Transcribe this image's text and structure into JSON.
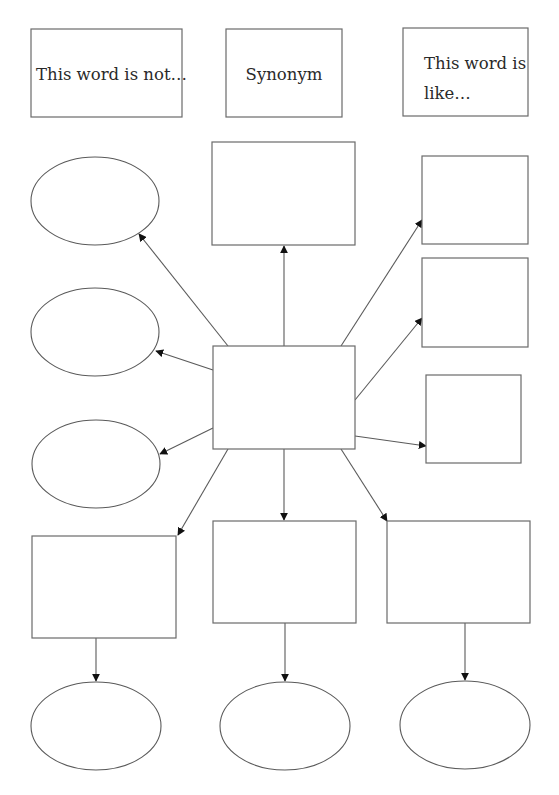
{
  "diagram": {
    "type": "vocabulary-concept-map",
    "header_boxes": [
      {
        "id": "not-box",
        "label_lines": [
          "This word is not…"
        ]
      },
      {
        "id": "synonym-box",
        "label_lines": [
          "Synonym"
        ]
      },
      {
        "id": "like-box",
        "label_lines": [
          "This word is",
          "like…"
        ]
      }
    ],
    "center_node": {
      "id": "center",
      "label": ""
    },
    "nodes": [
      {
        "id": "ellipse-left-1",
        "shape": "ellipse",
        "label": ""
      },
      {
        "id": "ellipse-left-2",
        "shape": "ellipse",
        "label": ""
      },
      {
        "id": "ellipse-left-3",
        "shape": "ellipse",
        "label": ""
      },
      {
        "id": "box-top",
        "shape": "rect",
        "label": ""
      },
      {
        "id": "box-right-1",
        "shape": "rect",
        "label": ""
      },
      {
        "id": "box-right-2",
        "shape": "rect",
        "label": ""
      },
      {
        "id": "box-right-3",
        "shape": "rect",
        "label": ""
      },
      {
        "id": "box-bottom-left",
        "shape": "rect",
        "label": ""
      },
      {
        "id": "box-bottom-center",
        "shape": "rect",
        "label": ""
      },
      {
        "id": "box-bottom-right",
        "shape": "rect",
        "label": ""
      },
      {
        "id": "ellipse-bottom-left",
        "shape": "ellipse",
        "label": ""
      },
      {
        "id": "ellipse-bottom-center",
        "shape": "ellipse",
        "label": ""
      },
      {
        "id": "ellipse-bottom-right",
        "shape": "ellipse",
        "label": ""
      }
    ],
    "edges": [
      {
        "from": "center",
        "to": "ellipse-left-1"
      },
      {
        "from": "center",
        "to": "ellipse-left-2"
      },
      {
        "from": "center",
        "to": "ellipse-left-3"
      },
      {
        "from": "center",
        "to": "box-top"
      },
      {
        "from": "center",
        "to": "box-right-1"
      },
      {
        "from": "center",
        "to": "box-right-2"
      },
      {
        "from": "center",
        "to": "box-right-3"
      },
      {
        "from": "center",
        "to": "box-bottom-left"
      },
      {
        "from": "center",
        "to": "box-bottom-center"
      },
      {
        "from": "center",
        "to": "box-bottom-right"
      },
      {
        "from": "box-bottom-left",
        "to": "ellipse-bottom-left"
      },
      {
        "from": "box-bottom-center",
        "to": "ellipse-bottom-center"
      },
      {
        "from": "box-bottom-right",
        "to": "ellipse-bottom-right"
      }
    ],
    "colors": {
      "line": "#5a5a5a",
      "arrowhead": "#111111",
      "text": "#2a2a2a",
      "background": "#ffffff"
    }
  }
}
